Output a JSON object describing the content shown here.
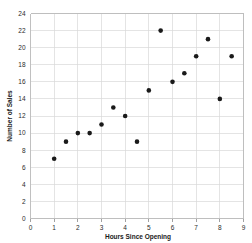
{
  "chart_data": {
    "type": "scatter",
    "title": "",
    "xlabel": "Hours Since Opening",
    "ylabel": "Number of Sales",
    "xlim": [
      0,
      9
    ],
    "ylim": [
      0,
      24
    ],
    "xticks": [
      0,
      1,
      2,
      3,
      4,
      5,
      6,
      7,
      8,
      9
    ],
    "yticks": [
      0,
      2,
      4,
      6,
      8,
      10,
      12,
      14,
      16,
      18,
      20,
      22,
      24
    ],
    "xtick_labels": [
      "0",
      "1",
      "2",
      "3",
      "4",
      "5",
      "6",
      "7",
      "8",
      "9"
    ],
    "ytick_labels": [
      "0",
      "2",
      "4",
      "6",
      "8",
      "10",
      "12",
      "14",
      "16",
      "18",
      "20",
      "22",
      "24"
    ],
    "grid": true,
    "legend": null,
    "series": [
      {
        "name": "Sales",
        "marker": "circle",
        "color": "#1a1a1a",
        "points": [
          {
            "x": 1.0,
            "y": 7
          },
          {
            "x": 1.5,
            "y": 9
          },
          {
            "x": 2.0,
            "y": 10
          },
          {
            "x": 2.5,
            "y": 10
          },
          {
            "x": 3.0,
            "y": 11
          },
          {
            "x": 3.5,
            "y": 13
          },
          {
            "x": 4.0,
            "y": 12
          },
          {
            "x": 4.5,
            "y": 9
          },
          {
            "x": 5.0,
            "y": 15
          },
          {
            "x": 5.5,
            "y": 22
          },
          {
            "x": 6.0,
            "y": 16
          },
          {
            "x": 6.5,
            "y": 17
          },
          {
            "x": 7.0,
            "y": 19
          },
          {
            "x": 7.5,
            "y": 21
          },
          {
            "x": 8.0,
            "y": 14
          },
          {
            "x": 8.5,
            "y": 19
          }
        ]
      }
    ]
  },
  "colors": {
    "grid": "#d9d9d9",
    "frame": "#b9b9b9",
    "marker": "#1a1a1a",
    "text": "#2b2b2b",
    "background": "#ffffff"
  }
}
